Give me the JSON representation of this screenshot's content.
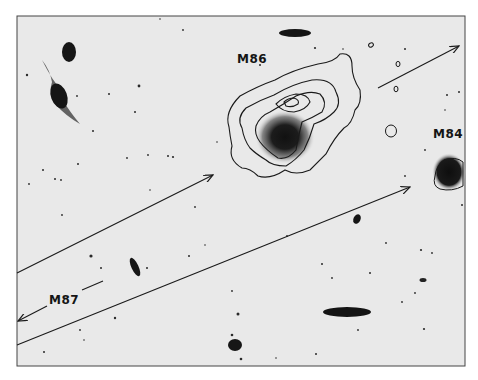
{
  "figure": {
    "background_color": "#e9e9e9",
    "ink_color": "#1a1a1a"
  },
  "labels": {
    "m86": "M86",
    "m84": "M84",
    "m87": "M87"
  },
  "arrows": [
    {
      "name": "arrow-to-m86",
      "from": [
        17,
        273
      ],
      "to": [
        213,
        175
      ]
    },
    {
      "name": "arrow-to-m84",
      "from": [
        17,
        345
      ],
      "to": [
        410,
        187
      ]
    },
    {
      "name": "arrow-upper-right",
      "from": [
        378,
        88
      ],
      "to": [
        459,
        46
      ]
    },
    {
      "name": "arrow-to-m87-offframe",
      "from": [
        47,
        306
      ],
      "to": [
        18,
        321
      ]
    }
  ]
}
